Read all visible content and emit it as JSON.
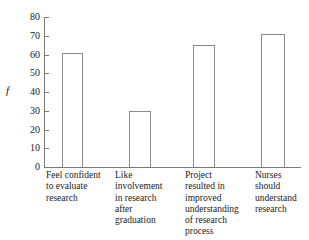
{
  "chart_data": {
    "type": "bar",
    "title": "",
    "xlabel": "",
    "ylabel": "f",
    "ylim": [
      0,
      80
    ],
    "yticks": [
      0,
      10,
      20,
      30,
      40,
      50,
      60,
      70,
      80
    ],
    "ytick_labels": [
      "0",
      "10",
      "20",
      "30",
      "40",
      "50",
      "60",
      "70",
      "80"
    ],
    "grid": false,
    "legend": "none",
    "bar_style": {
      "fill": "#ffffff",
      "edge": "#8a8a8a"
    },
    "categories": [
      "Feel confident\nto evaluate\nresearch",
      "Like\ninvolvement\nin research\nafter\ngraduation",
      "Project\nresulted in\nimproved\nunderstanding\nof research\nprocess",
      "Nurses\nshould\nunderstand\nresearch"
    ],
    "values": [
      61,
      30,
      65,
      71
    ]
  },
  "axes": {
    "y_label_text": "f"
  }
}
